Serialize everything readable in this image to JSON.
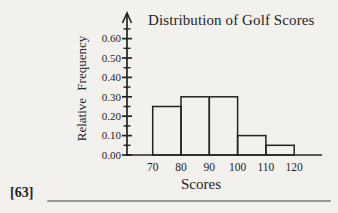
{
  "page": {
    "background": "#f2f1ee",
    "ink": "#232323",
    "rule_color": "#989898",
    "footnote": "[63]"
  },
  "chart_data": {
    "type": "bar",
    "subtype": "histogram",
    "title": "Distribution of Golf Scores",
    "xlabel": "Scores",
    "ylabel": "Relative Frequency",
    "bin_edges": [
      70,
      80,
      90,
      100,
      110,
      120
    ],
    "values": [
      0.25,
      0.3,
      0.3,
      0.1,
      0.05
    ],
    "x_tick_labels": [
      "70",
      "80",
      "90",
      "100",
      "110",
      "120"
    ],
    "y_major_ticks": [
      0.0,
      0.1,
      0.2,
      0.3,
      0.4,
      0.5,
      0.6
    ],
    "y_major_tick_labels": [
      "0.00",
      "0.10",
      "0.20",
      "0.30",
      "0.40",
      "0.50",
      "0.60"
    ],
    "y_minor_step": 0.05,
    "ylim": [
      0,
      0.65
    ],
    "grid": false,
    "bar_fill": "none",
    "legend": null
  }
}
